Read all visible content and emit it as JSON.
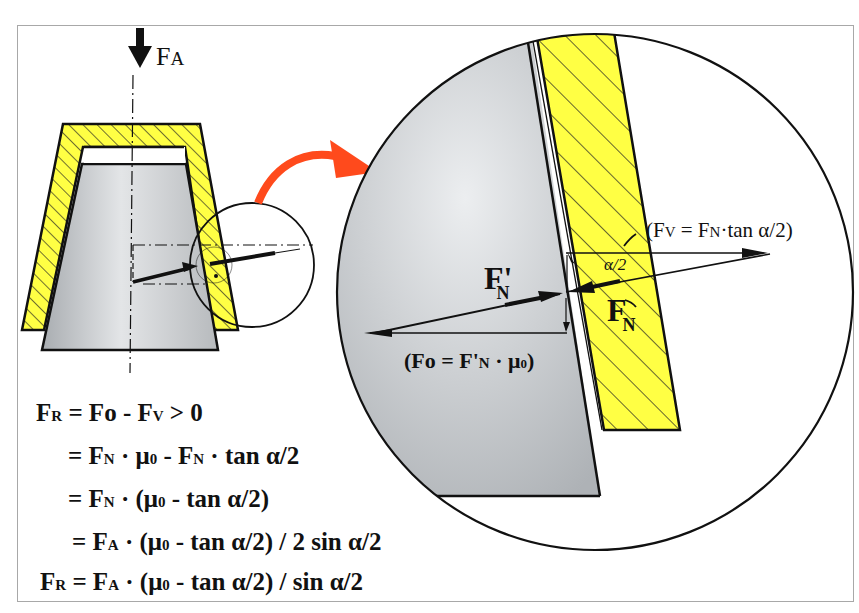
{
  "diagram": {
    "colors": {
      "hatch_fill": "#ffff44",
      "cone_fill": "#c8cbce",
      "arrow_accent": "#ff4a1c",
      "line": "#111111",
      "frame": "#a8a8a8"
    },
    "labels": {
      "axial_force": "F",
      "axial_force_sub": "A",
      "fv_label": "(FV = FN·tan α/2)",
      "fv_paren_open": "(F",
      "fv_sub": "V",
      "fv_eq": " = F",
      "fv_n_sub": "N",
      "fv_rest": "·tan α/2)",
      "alpha_half": "α/2",
      "fn_prime": "F'",
      "fn_prime_sub": "N",
      "fn": "F",
      "fn_sub": "N",
      "fo_open": "(Fo = F'",
      "fo_sub": "N",
      "fo_rest": " · μ",
      "fo_mu_sub": "0",
      "fo_close": ")"
    }
  },
  "equations": [
    {
      "id": "line1",
      "text": "FR = Fo - Fv > 0",
      "parts": [
        "F",
        "R",
        " = Fo - F",
        "V",
        " > 0"
      ]
    },
    {
      "id": "line2",
      "text": "= FN · μ0 - FN · tan α/2",
      "parts": [
        "= F",
        "N",
        " · μ",
        "0",
        " - F",
        "N",
        " · tan α/2"
      ]
    },
    {
      "id": "line3",
      "text": "= FN · (μ0 - tan α/2)",
      "parts": [
        "= F",
        "N",
        " · (μ",
        "0",
        " - tan α/2)"
      ]
    },
    {
      "id": "line4",
      "text": "= FA · (μ0 - tan α/2) / 2 sin α/2",
      "parts": [
        "= F",
        "A",
        " · (μ",
        "0",
        " - tan α/2) / 2 sin α/2"
      ]
    },
    {
      "id": "line5",
      "text": "FR = FA · (μ0 - tan α/2) / sin α/2",
      "parts": [
        "F",
        "R",
        " = F",
        "A",
        " · (μ",
        "0",
        " - tan α/2) / sin α/2"
      ]
    }
  ]
}
